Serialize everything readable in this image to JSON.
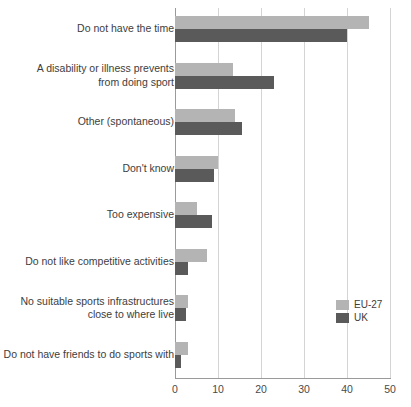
{
  "chart_data": {
    "type": "bar",
    "orientation": "horizontal",
    "title": "",
    "xlabel": "",
    "ylabel": "",
    "xlim": [
      0,
      50
    ],
    "xticks": [
      0,
      10,
      20,
      30,
      40,
      50
    ],
    "grid": "vertical",
    "legend_position": "right-lower",
    "categories": [
      "Do not have the time",
      "A disability or illness prevents\nfrom doing sport",
      "Other (spontaneous)",
      "Don't know",
      "Too expensive",
      "Do not like competitive activities",
      "No suitable sports infrastructures\nclose to where live",
      "Do not have friends to do sports with"
    ],
    "series": [
      {
        "name": "EU-27",
        "color": "#b4b4b4",
        "values": [
          45,
          13.5,
          14,
          10,
          5,
          7.5,
          3,
          3
        ]
      },
      {
        "name": "UK",
        "color": "#5a5a5a",
        "values": [
          40,
          23,
          15.5,
          9,
          8.5,
          3,
          2.5,
          1.5
        ]
      }
    ]
  },
  "axis": {
    "tick_labels": [
      "0",
      "10",
      "20",
      "30",
      "40",
      "50"
    ]
  },
  "legend": {
    "items": [
      {
        "label": "EU-27"
      },
      {
        "label": "UK"
      }
    ]
  }
}
